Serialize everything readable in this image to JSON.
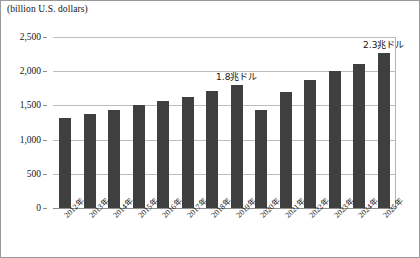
{
  "unit_caption": "(billion U.S. dollars)",
  "chart_data": {
    "type": "bar",
    "title": "",
    "subtitle": "",
    "xlabel": "",
    "ylabel": "(billion U.S. dollars)",
    "ylim": [
      0,
      2500
    ],
    "ytick_labels": [
      "0",
      "500",
      "1,000",
      "1,500",
      "2,000",
      "2,500"
    ],
    "ytick_values": [
      0,
      500,
      1000,
      1500,
      2000,
      2500
    ],
    "grid": true,
    "legend": "none",
    "bar_color": "#3f3f3f",
    "categories": [
      "2012年",
      "2013年",
      "2014年",
      "2015年",
      "2016年",
      "2017年",
      "2018年",
      "2019年",
      "2020年",
      "2021年",
      "2022年",
      "2023年",
      "2024年",
      "2025年"
    ],
    "values": [
      1320,
      1370,
      1440,
      1500,
      1560,
      1620,
      1710,
      1800,
      1430,
      1690,
      1870,
      2000,
      2110,
      2270
    ],
    "annotations": [
      {
        "text": "1.8兆ドル",
        "category": "2019年",
        "value": 1800
      },
      {
        "text": "2.3兆ドル",
        "category": "2025年",
        "value": 2270
      }
    ]
  }
}
